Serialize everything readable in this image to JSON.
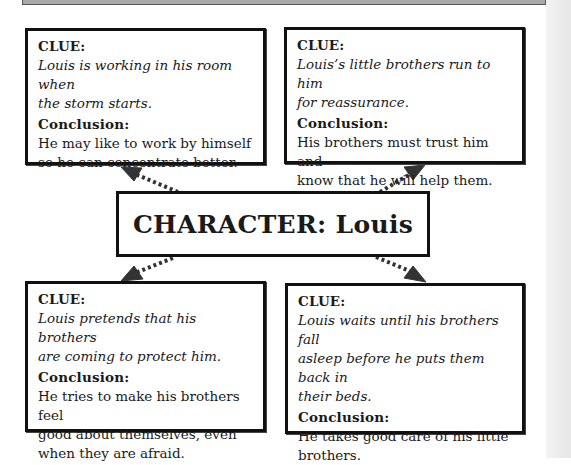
{
  "center": {
    "title": "CHARACTER: Louis"
  },
  "boxes": [
    {
      "position": "top-left",
      "clue_label": "CLUE:",
      "clue_lines": [
        "Louis is working in his room when",
        "the storm starts."
      ],
      "conclusion_label": "Conclusion:",
      "conclusion_lines": [
        "He may like to work by himself",
        "so he can concentrate better."
      ]
    },
    {
      "position": "top-right",
      "clue_label": "CLUE:",
      "clue_lines": [
        "Louis’s little brothers run to him",
        "for reassurance."
      ],
      "conclusion_label": "Conclusion:",
      "conclusion_lines": [
        "His brothers must trust him and",
        "know that he will help them."
      ]
    },
    {
      "position": "bottom-left",
      "clue_label": "CLUE:",
      "clue_lines": [
        "Louis pretends that his brothers",
        "are coming to protect him."
      ],
      "conclusion_label": "Conclusion:",
      "conclusion_lines": [
        "He tries to make his brothers feel",
        "good about themselves, even",
        "when they are afraid."
      ]
    },
    {
      "position": "bottom-right",
      "clue_label": "CLUE:",
      "clue_lines": [
        "Louis waits until his brothers fall",
        "asleep before he puts them back in",
        "their beds."
      ],
      "conclusion_label": "Conclusion:",
      "conclusion_lines": [
        "He takes good care of his little",
        "brothers."
      ]
    }
  ],
  "colors": {
    "border": "#111111",
    "arrow": "#333333",
    "top_bar": "#a9a9a9"
  }
}
